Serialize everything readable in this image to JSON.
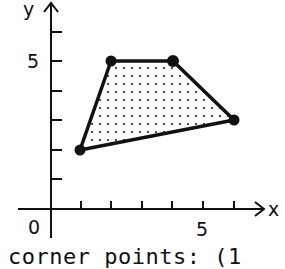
{
  "axes": {
    "x_label": "x",
    "y_label": "y",
    "origin_label": "0",
    "x_tick_label": "5",
    "y_tick_label": "5",
    "x_ticks": [
      1,
      2,
      3,
      4,
      5,
      6
    ],
    "y_ticks": [
      1,
      2,
      3,
      4,
      5,
      6
    ]
  },
  "region": {
    "fill_pattern": "dotted",
    "vertices": [
      [
        1,
        2
      ],
      [
        2,
        5
      ],
      [
        4,
        5
      ],
      [
        6,
        3
      ]
    ]
  },
  "caption": "corner points: (1"
}
